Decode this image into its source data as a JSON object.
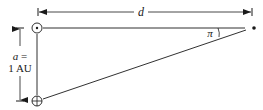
{
  "diagram": {
    "labels": {
      "distance": "d",
      "parallax_angle": "π",
      "baseline_var": "a =",
      "baseline_value": "1 AU"
    },
    "nodes": [
      {
        "id": "sun",
        "symbol": "sun-symbol",
        "x": 37,
        "y": 28
      },
      {
        "id": "earth",
        "symbol": "earth-symbol",
        "x": 37,
        "y": 101
      },
      {
        "id": "star",
        "symbol": "star-dot",
        "x": 254,
        "y": 28
      }
    ],
    "edges": [
      {
        "from": "sun",
        "to": "star",
        "style": "solid"
      },
      {
        "from": "sun",
        "to": "earth",
        "style": "solid"
      },
      {
        "from": "earth",
        "to": "star",
        "style": "solid"
      }
    ],
    "colors": {
      "stroke": "#1a1a1a",
      "background": "#ffffff"
    }
  }
}
